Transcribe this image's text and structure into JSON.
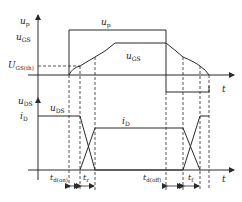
{
  "diagram": {
    "top_panel": {
      "y_axis_label": "u",
      "y_axis_sub": "p",
      "time_label": "t",
      "pulse_label": "u",
      "pulse_sub": "p",
      "ugs_axis_label": "u",
      "ugs_axis_sub": "GS",
      "ugs_curve_label": "u",
      "ugs_curve_sub": "GS",
      "threshold_label": "U",
      "threshold_sub": "GS(th)"
    },
    "bottom_panel": {
      "y_axis_label": "u",
      "y_axis_sub": "DS",
      "id_axis_label": "i",
      "id_axis_sub": "D",
      "uds_curve_label": "u",
      "uds_curve_sub": "DS",
      "id_curve_label": "i",
      "id_curve_sub": "D",
      "time_label": "t",
      "intervals": [
        {
          "label": "t",
          "sub": "d(on)"
        },
        {
          "label": "t",
          "sub": "r"
        },
        {
          "label": "t",
          "sub": "d(off)"
        },
        {
          "label": "t",
          "sub": "f"
        }
      ]
    },
    "colors": {
      "line": "#2a2a2a",
      "dash": "#2a2a2a",
      "background": "#ffffff"
    }
  }
}
